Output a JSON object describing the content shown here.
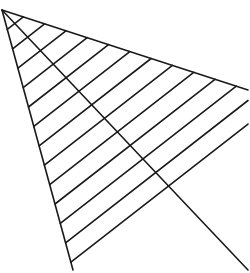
{
  "diagram": {
    "type": "hatched-triangle",
    "stroke_color": "#1a1a1a",
    "background": "#ffffff",
    "vertices": {
      "top_left": [
        2,
        10
      ],
      "right": [
        248,
        90
      ],
      "bottom": [
        73,
        270
      ]
    },
    "diagonal": [
      [
        2,
        10
      ],
      [
        248,
        270
      ]
    ],
    "hatch_count": 13
  }
}
